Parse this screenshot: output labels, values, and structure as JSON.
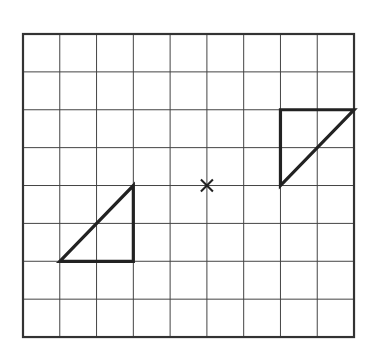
{
  "diagram": {
    "type": "grid-rotation",
    "grid": {
      "columns": 9,
      "rows": 8,
      "origin_px": [
        23,
        34
      ],
      "cell_w": 36.78,
      "cell_h": 37.88,
      "line_color": "#444444",
      "border_color": "#333333"
    },
    "center_mark": {
      "symbol": "cross",
      "grid_pos": [
        5,
        4
      ]
    },
    "shapes": [
      {
        "name": "triangle-a",
        "vertices": [
          [
            1,
            6
          ],
          [
            3,
            6
          ],
          [
            3,
            4
          ]
        ],
        "stroke": "#222222"
      },
      {
        "name": "triangle-b",
        "vertices": [
          [
            7,
            2
          ],
          [
            9,
            2
          ],
          [
            7,
            4
          ]
        ],
        "stroke": "#222222"
      }
    ]
  }
}
